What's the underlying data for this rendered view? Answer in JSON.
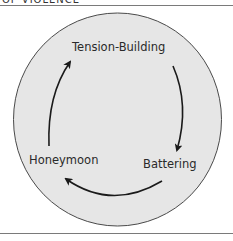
{
  "header": {
    "title_fragment": "OF VIOLENCE"
  },
  "diagram": {
    "type": "cycle",
    "background_color": "#e6e6e6",
    "stroke_color": "#333333",
    "stages": [
      {
        "label": "Tension-Building"
      },
      {
        "label": "Battering"
      },
      {
        "label": "Honeymoon"
      }
    ],
    "flow": [
      "Tension-Building -> Battering",
      "Battering -> Honeymoon",
      "Honeymoon -> Tension-Building"
    ]
  }
}
